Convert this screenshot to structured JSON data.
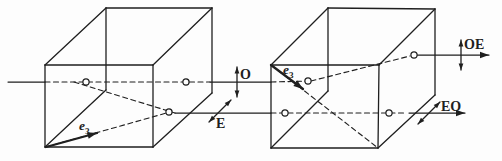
{
  "diagram": {
    "canvas": {
      "width": 502,
      "height": 161,
      "ink": "#1f1f1f",
      "background": "#fdfdfd"
    },
    "boxes": [
      {
        "name": "left-crystal",
        "edges": {
          "front_top": [
            45,
            65,
            153,
            65
          ],
          "front_left": [
            45,
            65,
            45,
            147
          ],
          "front_bottom": [
            45,
            147,
            153,
            147
          ],
          "front_right": [
            153,
            65,
            153,
            147
          ],
          "top_left_diagonal": [
            45,
            65,
            106,
            8
          ],
          "top_back": [
            106,
            8,
            212,
            8
          ],
          "top_right_diagonal": [
            153,
            65,
            212,
            8
          ],
          "back_right_vertical": [
            212,
            8,
            212,
            93
          ],
          "bottom_right_diagonal": [
            153,
            147,
            212,
            93
          ],
          "back_left_vertical": [
            106,
            8,
            106,
            90
          ],
          "bottom_back_left_diagonal": [
            45,
            147,
            106,
            90
          ]
        }
      },
      {
        "name": "right-crystal",
        "edges": {
          "front_top": [
            271,
            65,
            379,
            65
          ],
          "front_left": [
            271,
            65,
            271,
            148
          ],
          "front_bottom": [
            271,
            148,
            378,
            148
          ],
          "front_right": [
            379,
            65,
            378,
            148
          ],
          "top_left_diagonal": [
            271,
            65,
            328,
            8
          ],
          "top_back": [
            328,
            8,
            435,
            9
          ],
          "top_right_diagonal": [
            379,
            65,
            435,
            9
          ],
          "back_right_vertical": [
            435,
            9,
            435,
            95
          ],
          "bottom_right_diagonal": [
            378,
            148,
            435,
            95
          ],
          "back_left_vertical": [
            328,
            8,
            328,
            91
          ],
          "bottom_back_left_diagonal": [
            271,
            148,
            328,
            91
          ]
        }
      }
    ],
    "solid_rays": [
      {
        "name": "incident-ray",
        "p": [
          8,
          82,
          45,
          82
        ]
      },
      {
        "name": "o-ray-between-crystals",
        "p": [
          210,
          82,
          271,
          82
        ]
      },
      {
        "name": "e-ray-between-crystals",
        "p": [
          175,
          113,
          271,
          113
        ]
      }
    ],
    "dashed_rays": [
      {
        "name": "o-ray-in-left-crystal",
        "p": [
          45,
          82,
          210,
          82
        ]
      },
      {
        "name": "e-ray-walkoff-in-left-crystal",
        "p": [
          74,
          82,
          175,
          113
        ]
      },
      {
        "name": "oe-ray-in-right-crystal-straight",
        "p": [
          271,
          82,
          311,
          81
        ]
      },
      {
        "name": "oe-ray-in-right-crystal-walkoff",
        "p": [
          311,
          81,
          410,
          56
        ]
      },
      {
        "name": "eo-ray-in-right-crystal",
        "p": [
          271,
          113,
          406,
          113
        ]
      }
    ],
    "exit_rays": [
      {
        "name": "oe-exit-ray",
        "p": [
          417,
          55,
          489,
          55
        ]
      },
      {
        "name": "eo-exit-ray",
        "p": [
          409,
          113,
          465,
          113
        ]
      }
    ],
    "optic_axes": [
      {
        "name": "optic-axis-left-crystal",
        "arrow": [
          46,
          147,
          97,
          133
        ],
        "dashed_line": [
          46,
          147,
          170,
          112
        ],
        "label": {
          "text": "e",
          "sub": "3",
          "x": 79,
          "y": 130,
          "size": 13.5,
          "italic": true
        }
      },
      {
        "name": "optic-axis-right-crystal",
        "arrow": [
          271,
          65,
          303,
          89
        ],
        "dashed_line": [
          271,
          65,
          378,
          148
        ],
        "label": {
          "text": "e",
          "sub": "3",
          "x": 283,
          "y": 74,
          "size": 13.5,
          "italic": true
        }
      }
    ],
    "polarization_arrows": [
      {
        "name": "o-polarization-arrow",
        "p": [
          237,
          67,
          237,
          97
        ],
        "label": {
          "text": "O",
          "x": 240,
          "y": 79,
          "size": 14
        }
      },
      {
        "name": "e-polarization-arrow",
        "p": [
          209,
          122,
          231,
          100
        ],
        "label": {
          "text": "E",
          "x": 216,
          "y": 128,
          "size": 14
        }
      },
      {
        "name": "oe-polarization-arrow",
        "p": [
          461,
          40,
          461,
          70
        ],
        "label": {
          "text": "OE",
          "x": 464,
          "y": 49,
          "size": 14
        }
      },
      {
        "name": "eo-polarization-arrow",
        "p": [
          418,
          124,
          440,
          102
        ],
        "label": {
          "text": "EO",
          "x": 441,
          "y": 111,
          "size": 14
        }
      }
    ],
    "ray_markers": [
      [
        86,
        82
      ],
      [
        186,
        82
      ],
      [
        169,
        112
      ],
      [
        308,
        81
      ],
      [
        414,
        55
      ],
      [
        285,
        113
      ],
      [
        389,
        113
      ]
    ]
  }
}
